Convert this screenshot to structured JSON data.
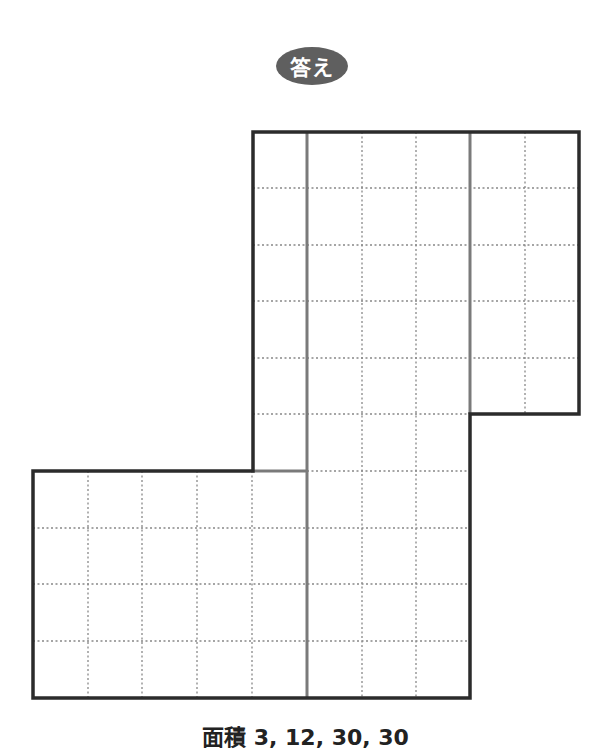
{
  "header": {
    "badge_label": "答え"
  },
  "figure": {
    "origin_px": [
      33,
      132
    ],
    "cell_px": [
      54.6,
      56.6
    ],
    "columns": 10,
    "rows": 10,
    "regions": [
      {
        "name": "top-right-block",
        "cols": [
          4,
          10
        ],
        "rows": [
          0,
          5
        ]
      },
      {
        "name": "middle-strip",
        "cols": [
          5,
          8
        ],
        "rows": [
          0,
          10
        ]
      },
      {
        "name": "bottom-left-block",
        "cols": [
          0,
          8
        ],
        "rows": [
          6,
          10
        ]
      }
    ],
    "colors": {
      "outline": "#2b2b2b",
      "divider": "#7a7a7a",
      "dotted": "#888888"
    }
  },
  "footer": {
    "caption": "面積 3, 12, 30, 30"
  }
}
